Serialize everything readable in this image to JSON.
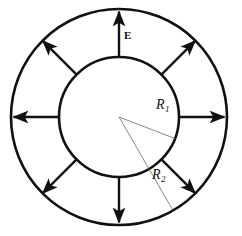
{
  "figure": {
    "type": "annulus-with-radial-arrows",
    "background_color": "#ffffff",
    "stroke_color": "#111111",
    "thin_stroke_color": "#6b6b6b",
    "geometry": {
      "center_x": 119,
      "center_y": 117,
      "outer_radius": 108,
      "inner_radius": 60,
      "spoke_count": 8,
      "spoke_angles_deg": [
        270,
        315,
        0,
        45,
        90,
        135,
        180,
        225
      ],
      "outer_stroke_width": 2.6,
      "inner_stroke_width": 2.6,
      "spoke_stroke_width": 2.4,
      "radius_line_stroke_width": 0.8,
      "r1_line_angle_deg": 21,
      "r2_line_angle_deg": 60
    },
    "labels": {
      "thickness": "E",
      "inner_radius_symbol": "R",
      "inner_radius_subscript": "1",
      "outer_radius_symbol": "R",
      "outer_radius_subscript": "2"
    }
  }
}
